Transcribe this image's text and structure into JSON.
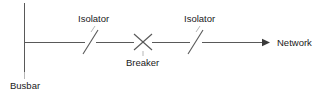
{
  "diagram": {
    "labels": {
      "busbar": "Busbar",
      "isolator_left": "Isolator",
      "breaker": "Breaker",
      "isolator_right": "Isolator",
      "network": "Network"
    },
    "colors": {
      "line": "#595959",
      "text": "#1a1a1a",
      "background": "#ffffff"
    },
    "symbols": [
      {
        "name": "busbar-bar",
        "type": "vertical-line",
        "x": 24,
        "y1": 3,
        "y2": 72
      },
      {
        "name": "conductor-busbar-to-isolator-1",
        "type": "horizontal-line",
        "y": 42,
        "x1": 24,
        "x2": 85
      },
      {
        "name": "isolator-1-blade",
        "type": "slash",
        "x1": 83,
        "y1": 54,
        "x2": 98,
        "y2": 30
      },
      {
        "name": "conductor-isolator-1-to-breaker",
        "type": "horizontal-line",
        "y": 42,
        "x1": 96,
        "x2": 134
      },
      {
        "name": "breaker-cross",
        "type": "cross",
        "cx": 143,
        "cy": 42,
        "size": 9
      },
      {
        "name": "conductor-breaker-to-isolator-2",
        "type": "horizontal-line",
        "y": 42,
        "x1": 152,
        "x2": 190
      },
      {
        "name": "isolator-2-blade",
        "type": "slash",
        "x1": 188,
        "y1": 54,
        "x2": 203,
        "y2": 30
      },
      {
        "name": "conductor-isolator-2-to-network",
        "type": "arrow",
        "y": 42,
        "x1": 202,
        "x2": 268
      }
    ],
    "leader_lines": [
      {
        "name": "leader-isolator-1",
        "x1": 95,
        "y1": 25,
        "x2": 90,
        "y2": 33
      },
      {
        "name": "leader-isolator-2",
        "x1": 200,
        "y1": 25,
        "x2": 195,
        "y2": 33
      },
      {
        "name": "leader-breaker",
        "x1": 143,
        "y1": 56,
        "x2": 143,
        "y2": 50
      },
      {
        "name": "leader-busbar",
        "x1": 24,
        "y1": 72,
        "x2": 24,
        "y2": 78
      }
    ]
  }
}
